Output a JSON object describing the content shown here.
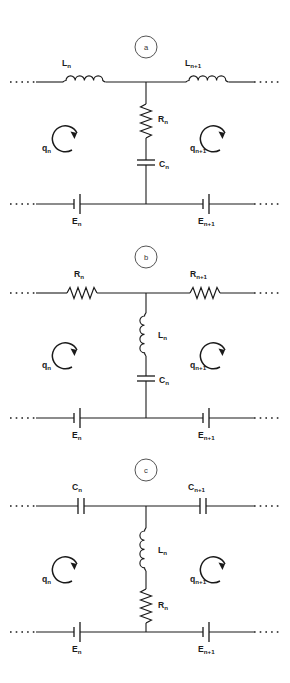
{
  "figure": {
    "type": "circuit-diagram",
    "background": "#ffffff",
    "line_color": "#1a1a1a",
    "panels": [
      {
        "id": "a",
        "marker_label": "a",
        "series_branch_components": [
          "inductor",
          "inductor"
        ],
        "shunt_branch_components": [
          "resistor",
          "capacitor"
        ],
        "labels": {
          "series_left": {
            "symbol": "L",
            "sub": "n"
          },
          "series_right": {
            "symbol": "L",
            "sub": "n+1"
          },
          "shunt_upper": {
            "symbol": "R",
            "sub": "n"
          },
          "shunt_lower": {
            "symbol": "C",
            "sub": "n"
          },
          "loop_left": {
            "symbol": "q",
            "sub": "n"
          },
          "loop_right": {
            "symbol": "q",
            "sub": "n+1"
          },
          "emf_left": {
            "symbol": "E",
            "sub": "n"
          },
          "emf_right": {
            "symbol": "E",
            "sub": "n+1"
          }
        }
      },
      {
        "id": "b",
        "marker_label": "b",
        "series_branch_components": [
          "resistor",
          "resistor"
        ],
        "shunt_branch_components": [
          "inductor",
          "capacitor"
        ],
        "labels": {
          "series_left": {
            "symbol": "R",
            "sub": "n"
          },
          "series_right": {
            "symbol": "R",
            "sub": "n+1"
          },
          "shunt_upper": {
            "symbol": "L",
            "sub": "n"
          },
          "shunt_lower": {
            "symbol": "C",
            "sub": "n"
          },
          "loop_left": {
            "symbol": "q",
            "sub": "n"
          },
          "loop_right": {
            "symbol": "q",
            "sub": "n+1"
          },
          "emf_left": {
            "symbol": "E",
            "sub": "n"
          },
          "emf_right": {
            "symbol": "E",
            "sub": "n+1"
          }
        }
      },
      {
        "id": "c",
        "marker_label": "c",
        "series_branch_components": [
          "capacitor",
          "capacitor"
        ],
        "shunt_branch_components": [
          "inductor",
          "resistor"
        ],
        "labels": {
          "series_left": {
            "symbol": "C",
            "sub": "n"
          },
          "series_right": {
            "symbol": "C",
            "sub": "n+1"
          },
          "shunt_upper": {
            "symbol": "L",
            "sub": "n"
          },
          "shunt_lower": {
            "symbol": "R",
            "sub": "n"
          },
          "loop_left": {
            "symbol": "q",
            "sub": "n"
          },
          "loop_right": {
            "symbol": "q",
            "sub": "n+1"
          },
          "emf_left": {
            "symbol": "E",
            "sub": "n"
          },
          "emf_right": {
            "symbol": "E",
            "sub": "n+1"
          }
        }
      }
    ]
  }
}
